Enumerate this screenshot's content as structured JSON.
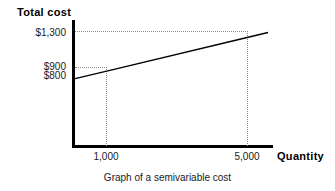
{
  "chart_data": {
    "type": "line",
    "title": "Graph of a semivariable cost",
    "xlabel": "Quantity",
    "ylabel": "Total cost",
    "xlim": [
      0,
      5600
    ],
    "ylim": [
      0,
      1450
    ],
    "grid": "dotted guide lines at marked values only",
    "legend": "none",
    "series": [
      {
        "name": "Semivariable cost",
        "x": [
          0,
          1000,
          5000,
          5600
        ],
        "y": [
          800,
          900,
          1300,
          1360
        ],
        "fixed_component": 800,
        "variable_rate_per_unit": 0.1
      }
    ],
    "x_ticks": [
      {
        "value": 1000,
        "label": "1,000"
      },
      {
        "value": 5000,
        "label": "5,000"
      }
    ],
    "y_ticks": [
      {
        "value": 1300,
        "label": "$1,300"
      },
      {
        "value": 900,
        "label": "$900"
      },
      {
        "value": 800,
        "label": "$800"
      }
    ],
    "annotations": [
      "Horizontal dotted guide from $1,300 to the 5,000 quantity point",
      "Horizontal dotted guide from $900 to the 1,000 quantity point",
      "Vertical dotted guide at 1,000 down to the quantity axis",
      "Vertical dotted guide at 5,000 down to the quantity axis"
    ]
  },
  "axes": {
    "y_title": "Total cost",
    "x_title": "Quantity"
  },
  "y_labels": {
    "high": "$1,300",
    "mid": "$900",
    "low": "$800"
  },
  "x_labels": {
    "first": "1,000",
    "second": "5,000"
  },
  "caption": {
    "text": "Graph of a semivariable cost"
  },
  "colors": {
    "axis": "#000000",
    "line": "#000000",
    "guide": "#8a8a8a",
    "text": "#1a1a1a",
    "background": "#ffffff"
  }
}
